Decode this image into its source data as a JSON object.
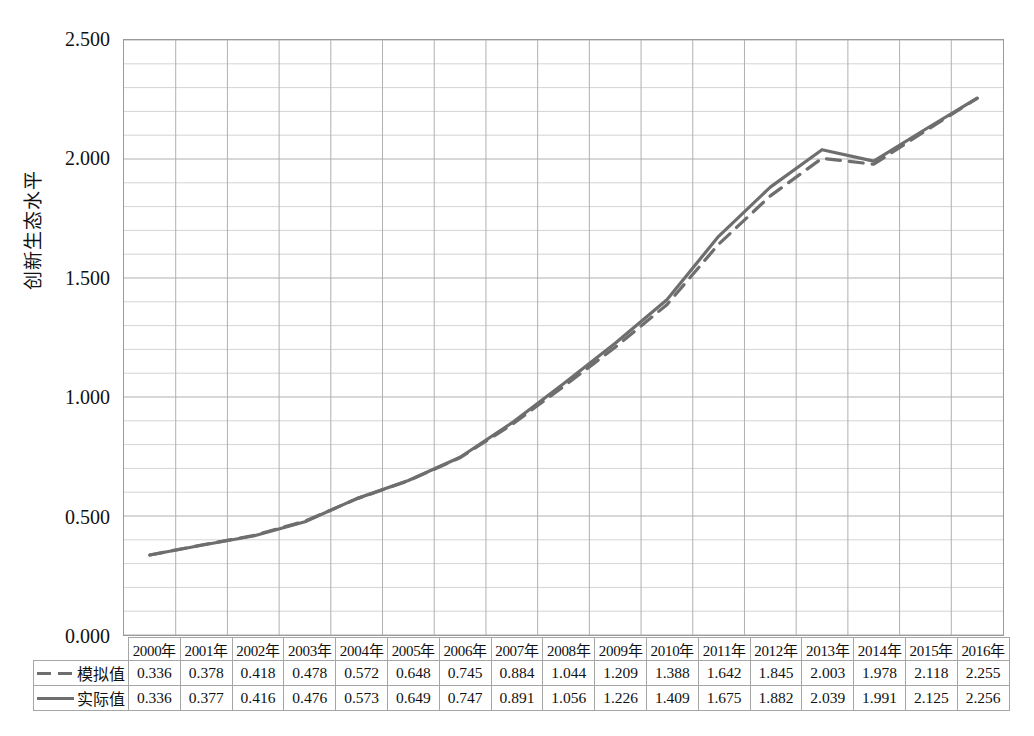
{
  "chart_data": {
    "type": "line",
    "title": "",
    "xlabel": "",
    "ylabel": "创新生态水平",
    "ylim": [
      0.0,
      2.5
    ],
    "ytick_labels": [
      "2.500",
      "2.000",
      "1.500",
      "1.000",
      "0.500",
      "0.000"
    ],
    "ytick_values": [
      2.5,
      2.0,
      1.5,
      1.0,
      0.5,
      0.0
    ],
    "grid": true,
    "grid_minor_step": 0.1,
    "grid_major_step": 0.5,
    "legend_position": "table-row-labels",
    "categories": [
      "2000年",
      "2001年",
      "2002年",
      "2003年",
      "2004年",
      "2005年",
      "2006年",
      "2007年",
      "2008年",
      "2009年",
      "2010年",
      "2011年",
      "2012年",
      "2013年",
      "2014年",
      "2015年",
      "2016年"
    ],
    "series": [
      {
        "name": "模拟值",
        "style": "dashed",
        "color": "#6e6e6e",
        "values": [
          0.336,
          0.378,
          0.418,
          0.478,
          0.572,
          0.648,
          0.745,
          0.884,
          1.044,
          1.209,
          1.388,
          1.642,
          1.845,
          2.003,
          1.978,
          2.118,
          2.255
        ],
        "value_labels": [
          "0.336",
          "0.378",
          "0.418",
          "0.478",
          "0.572",
          "0.648",
          "0.745",
          "0.884",
          "1.044",
          "1.209",
          "1.388",
          "1.642",
          "1.845",
          "2.003",
          "1.978",
          "2.118",
          "2.255"
        ]
      },
      {
        "name": "实际值",
        "style": "solid",
        "color": "#6e6e6e",
        "values": [
          0.336,
          0.377,
          0.416,
          0.476,
          0.573,
          0.649,
          0.747,
          0.891,
          1.056,
          1.226,
          1.409,
          1.675,
          1.882,
          2.039,
          1.991,
          2.125,
          2.256
        ],
        "value_labels": [
          "0.336",
          "0.377",
          "0.416",
          "0.476",
          "0.573",
          "0.649",
          "0.747",
          "0.891",
          "1.056",
          "1.226",
          "1.409",
          "1.675",
          "1.882",
          "2.039",
          "1.991",
          "2.125",
          "2.256"
        ]
      }
    ]
  },
  "colors": {
    "line": "#6e6e6e",
    "grid_minor": "#d4d4d4",
    "grid_major": "#b0b0b0",
    "axis": "#9a9a9a",
    "text": "#111111"
  }
}
